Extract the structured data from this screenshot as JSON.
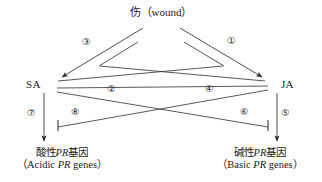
{
  "diagram": {
    "title": "伤（wound）",
    "nodes": {
      "sa": "SA",
      "ja": "JA"
    },
    "outputs": {
      "acidic_cn": "酸性PR基因",
      "acidic_en": "（Acidic PR genes）",
      "acidic_en_pre": "（Acidic ",
      "acidic_en_it": "PR",
      "acidic_en_post": " genes）",
      "basic_cn": "碱性PR基因",
      "basic_en": "（Basic PR genes）",
      "basic_en_pre": "（Basic ",
      "basic_en_it": "PR",
      "basic_en_post": " genes）"
    },
    "edge_labels": {
      "one": "①",
      "two": "②",
      "three": "③",
      "four": "④",
      "five": "⑤",
      "six": "⑥",
      "seven": "⑦",
      "eight": "⑧"
    },
    "colors": {
      "line": "#3a3a3a",
      "text": "#1a1a1a",
      "background": "#ffffff"
    }
  }
}
